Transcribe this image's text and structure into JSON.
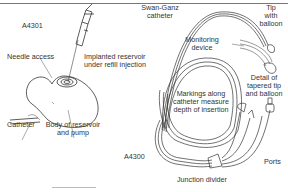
{
  "left_figure": {
    "code": "A4301",
    "labels": {
      "needle_access": "Needle access",
      "implanted_reservoir_1": "Implanted reservoir",
      "implanted_reservoir_2": "under refill injection",
      "catheter": "Catheter",
      "body_1": "Body of reservoir",
      "body_2": "and pump"
    }
  },
  "right_figure": {
    "code": "A4300",
    "labels": {
      "swan_ganz_1": "Swan-Ganz",
      "swan_ganz_2": "catheter",
      "tip_1": "Tip",
      "tip_2": "with",
      "tip_3": "balloon",
      "monitoring_1": "Monitoring",
      "monitoring_2": "device",
      "detail_1": "Detail of",
      "detail_2": "tapered tip",
      "detail_3": "and balloon",
      "markings_1": "Markings along",
      "markings_2": "catheter measure",
      "markings_3": "depth of insertion",
      "ports": "Ports",
      "junction": "Junction divider"
    }
  }
}
